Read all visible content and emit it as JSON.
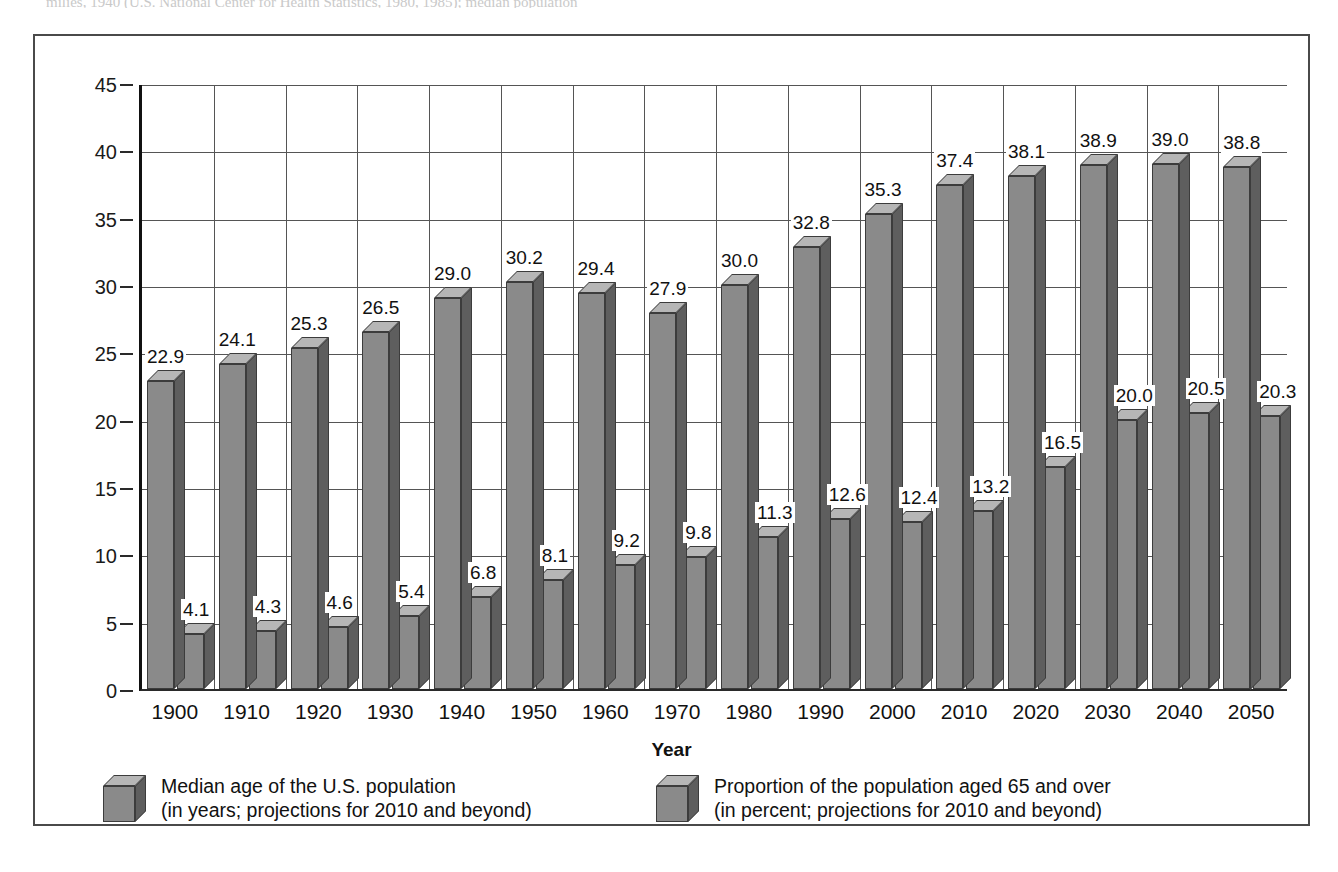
{
  "page": {
    "bleed_text": "milies, 1940 (U.S. National Center for Health Statistics, 1980, 1985); median population"
  },
  "chart_data": {
    "type": "bar",
    "title": "",
    "xlabel": "Year",
    "ylabel": "",
    "ylim": [
      0,
      45
    ],
    "ytick_step": 5,
    "yticks": [
      "0",
      "5",
      "10",
      "15",
      "20",
      "25",
      "30",
      "35",
      "40",
      "45"
    ],
    "grid": true,
    "legend_position": "bottom",
    "style": "3d-grouped-bar",
    "categories": [
      "1900",
      "1910",
      "1920",
      "1930",
      "1940",
      "1950",
      "1960",
      "1970",
      "1980",
      "1990",
      "2000",
      "2010",
      "2020",
      "2030",
      "2040",
      "2050"
    ],
    "series": [
      {
        "name": "Median age of the U.S. population",
        "legend_line1": "Median age of the U.S. population",
        "legend_line2": "(in years; projections for 2010 and beyond)",
        "unit": "years",
        "values": [
          22.9,
          24.1,
          25.3,
          26.5,
          29.0,
          30.2,
          29.4,
          27.9,
          30.0,
          32.8,
          35.3,
          37.4,
          38.1,
          38.9,
          39.0,
          38.8
        ],
        "labels": [
          "22.9",
          "24.1",
          "25.3",
          "26.5",
          "29.0",
          "30.2",
          "29.4",
          "27.9",
          "30.0",
          "32.8",
          "35.3",
          "37.4",
          "38.1",
          "38.9",
          "39.0",
          "38.8"
        ]
      },
      {
        "name": "Proportion of the population aged 65 and over",
        "legend_line1": "Proportion of the population aged 65 and over",
        "legend_line2": "(in percent; projections for 2010 and beyond)",
        "unit": "percent",
        "values": [
          4.1,
          4.3,
          4.6,
          5.4,
          6.8,
          8.1,
          9.2,
          9.8,
          11.3,
          12.6,
          12.4,
          13.2,
          16.5,
          20.0,
          20.5,
          20.3
        ],
        "labels": [
          "4.1",
          "4.3",
          "4.6",
          "5.4",
          "6.8",
          "8.1",
          "9.2",
          "9.8",
          "11.3",
          "12.6",
          "12.4",
          "13.2",
          "16.5",
          "20.0",
          "20.5",
          "20.3"
        ]
      }
    ]
  },
  "colors": {
    "bar_front": "#8a8a8a",
    "bar_top": "#b6b6b6",
    "bar_side": "#5e5e5e",
    "outline": "#3c3c3c",
    "grid": "#555555",
    "axis": "#111111",
    "frame": "#4a4a4a",
    "text": "#111111"
  }
}
